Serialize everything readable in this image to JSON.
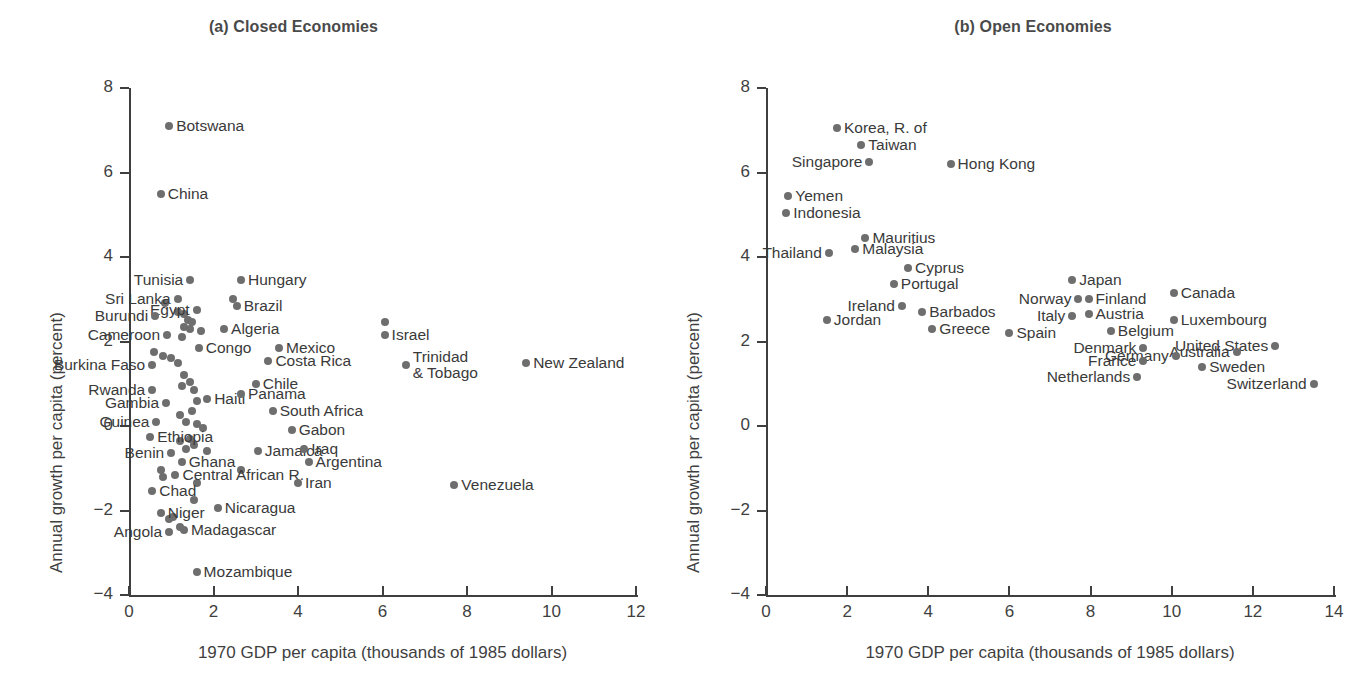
{
  "figure": {
    "panels": [
      {
        "id": "a",
        "title": "(a) Closed Economies",
        "xlabel": "1970 GDP per capita (thousands of 1985 dollars)",
        "ylabel": "Annual growth per capita (percent)"
      },
      {
        "id": "b",
        "title": "(b) Open Economies",
        "xlabel": "1970 GDP per capita (thousands of 1985 dollars)",
        "ylabel": "Annual growth per capita (percent)"
      }
    ]
  },
  "chart_data": [
    {
      "type": "scatter",
      "title": "(a) Closed Economies",
      "xlabel": "1970 GDP per capita (thousands of 1985 dollars)",
      "ylabel": "Annual growth per capita (percent)",
      "xlim": [
        0,
        12
      ],
      "ylim": [
        -4,
        8
      ],
      "xticks": [
        0,
        2,
        4,
        6,
        8,
        10,
        12
      ],
      "yticks": [
        8,
        6,
        4,
        2,
        0,
        -2,
        -4
      ],
      "grid": false,
      "legend": null,
      "marker_color": "#6e6e6e",
      "points": [
        {
          "label": "Botswana",
          "x": 0.95,
          "y": 7.1,
          "side": "l"
        },
        {
          "label": "China",
          "x": 0.75,
          "y": 5.5,
          "side": "l"
        },
        {
          "label": "Tunisia",
          "x": 1.45,
          "y": 3.45,
          "side": "r"
        },
        {
          "label": "Hungary",
          "x": 2.65,
          "y": 3.45,
          "side": "l"
        },
        {
          "label": "Sri Lanka",
          "x": 1.15,
          "y": 3.0,
          "side": "r"
        },
        {
          "label": "Brazil",
          "x": 2.55,
          "y": 2.85,
          "side": "l"
        },
        {
          "label": "Egypt",
          "x": 1.6,
          "y": 2.75,
          "side": "r"
        },
        {
          "label": "Burundi",
          "x": 0.62,
          "y": 2.6,
          "side": "r"
        },
        {
          "label": "Algeria",
          "x": 2.25,
          "y": 2.3,
          "side": "l"
        },
        {
          "label": "Cameroon",
          "x": 0.9,
          "y": 2.15,
          "side": "r"
        },
        {
          "label": "Congo",
          "x": 1.65,
          "y": 1.85,
          "side": "l"
        },
        {
          "label": "Israel",
          "x": 6.05,
          "y": 2.15,
          "side": "l"
        },
        {
          "label": "Mexico",
          "x": 3.55,
          "y": 1.85,
          "side": "l"
        },
        {
          "label": "Costa Rica",
          "x": 3.3,
          "y": 1.55,
          "side": "l"
        },
        {
          "label": "Burkina Faso",
          "x": 0.55,
          "y": 1.45,
          "side": "r"
        },
        {
          "label": "Trinidad\n& Tobago",
          "x": 6.55,
          "y": 1.45,
          "side": "l"
        },
        {
          "label": "New Zealand",
          "x": 9.4,
          "y": 1.5,
          "side": "l"
        },
        {
          "label": "Chile",
          "x": 3.0,
          "y": 1.0,
          "side": "l"
        },
        {
          "label": "Rwanda",
          "x": 0.55,
          "y": 0.85,
          "side": "r"
        },
        {
          "label": "Haiti",
          "x": 1.85,
          "y": 0.65,
          "side": "l"
        },
        {
          "label": "Panama",
          "x": 2.65,
          "y": 0.75,
          "side": "l"
        },
        {
          "label": "Gambia",
          "x": 0.88,
          "y": 0.55,
          "side": "r"
        },
        {
          "label": "South Africa",
          "x": 3.4,
          "y": 0.35,
          "side": "l"
        },
        {
          "label": "Guinea",
          "x": 0.65,
          "y": 0.1,
          "side": "r"
        },
        {
          "label": "Gabon",
          "x": 3.85,
          "y": -0.1,
          "side": "l"
        },
        {
          "label": "Ethiopia",
          "x": 0.5,
          "y": -0.25,
          "side": "l"
        },
        {
          "label": "Jamaica",
          "x": 3.05,
          "y": -0.6,
          "side": "l"
        },
        {
          "label": "Iraq",
          "x": 4.15,
          "y": -0.55,
          "side": "l"
        },
        {
          "label": "Benin",
          "x": 1.0,
          "y": -0.65,
          "side": "r"
        },
        {
          "label": "Argentina",
          "x": 4.25,
          "y": -0.85,
          "side": "l"
        },
        {
          "label": "Ghana",
          "x": 1.25,
          "y": -0.85,
          "side": "l"
        },
        {
          "label": "Central African R.",
          "x": 1.1,
          "y": -1.15,
          "side": "l"
        },
        {
          "label": "Iran",
          "x": 4.0,
          "y": -1.35,
          "side": "l"
        },
        {
          "label": "Venezuela",
          "x": 7.7,
          "y": -1.4,
          "side": "l"
        },
        {
          "label": "Chad",
          "x": 0.55,
          "y": -1.55,
          "side": "l"
        },
        {
          "label": "Niger",
          "x": 0.75,
          "y": -2.05,
          "side": "l"
        },
        {
          "label": "Nicaragua",
          "x": 2.1,
          "y": -1.95,
          "side": "l"
        },
        {
          "label": "Madagascar",
          "x": 1.3,
          "y": -2.45,
          "side": "l"
        },
        {
          "label": "Angola",
          "x": 0.95,
          "y": -2.5,
          "side": "r"
        },
        {
          "label": "Mozambique",
          "x": 1.6,
          "y": -3.45,
          "side": "l"
        }
      ],
      "unlabeled_points": [
        {
          "x": 0.85,
          "y": 2.9
        },
        {
          "x": 1.15,
          "y": 2.7
        },
        {
          "x": 1.3,
          "y": 2.65
        },
        {
          "x": 1.4,
          "y": 2.5
        },
        {
          "x": 1.5,
          "y": 2.45
        },
        {
          "x": 1.3,
          "y": 2.35
        },
        {
          "x": 1.45,
          "y": 2.3
        },
        {
          "x": 1.7,
          "y": 2.25
        },
        {
          "x": 1.25,
          "y": 2.1
        },
        {
          "x": 0.6,
          "y": 1.75
        },
        {
          "x": 0.8,
          "y": 1.65
        },
        {
          "x": 1.0,
          "y": 1.6
        },
        {
          "x": 1.15,
          "y": 1.5
        },
        {
          "x": 1.3,
          "y": 1.2
        },
        {
          "x": 1.45,
          "y": 1.05
        },
        {
          "x": 1.25,
          "y": 0.95
        },
        {
          "x": 1.55,
          "y": 0.85
        },
        {
          "x": 1.6,
          "y": 0.6
        },
        {
          "x": 1.5,
          "y": 0.35
        },
        {
          "x": 1.2,
          "y": 0.25
        },
        {
          "x": 1.35,
          "y": 0.1
        },
        {
          "x": 1.6,
          "y": 0.05
        },
        {
          "x": 1.75,
          "y": -0.05
        },
        {
          "x": 1.45,
          "y": -0.3
        },
        {
          "x": 1.2,
          "y": -0.35
        },
        {
          "x": 1.55,
          "y": -0.45
        },
        {
          "x": 1.35,
          "y": -0.55
        },
        {
          "x": 1.85,
          "y": -0.6
        },
        {
          "x": 0.75,
          "y": -1.05
        },
        {
          "x": 0.8,
          "y": -1.2
        },
        {
          "x": 2.65,
          "y": -1.05
        },
        {
          "x": 1.6,
          "y": -1.35
        },
        {
          "x": 1.05,
          "y": -2.15
        },
        {
          "x": 0.95,
          "y": -2.2
        },
        {
          "x": 1.55,
          "y": -1.75
        },
        {
          "x": 1.2,
          "y": -2.4
        },
        {
          "x": 2.45,
          "y": 3.0
        },
        {
          "x": 6.05,
          "y": 2.45
        }
      ]
    },
    {
      "type": "scatter",
      "title": "(b) Open Economies",
      "xlabel": "1970 GDP per capita (thousands of 1985 dollars)",
      "ylabel": "Annual growth per capita (percent)",
      "xlim": [
        0,
        14
      ],
      "ylim": [
        -4,
        8
      ],
      "xticks": [
        0,
        2,
        4,
        6,
        8,
        10,
        12,
        14
      ],
      "yticks": [
        8,
        6,
        4,
        2,
        0,
        -2,
        -4
      ],
      "grid": false,
      "legend": null,
      "marker_color": "#6e6e6e",
      "points": [
        {
          "label": "Korea, R. of",
          "x": 1.75,
          "y": 7.05,
          "side": "l"
        },
        {
          "label": "Taiwan",
          "x": 2.35,
          "y": 6.65,
          "side": "l"
        },
        {
          "label": "Singapore",
          "x": 2.55,
          "y": 6.25,
          "side": "r"
        },
        {
          "label": "Hong Kong",
          "x": 4.55,
          "y": 6.2,
          "side": "l"
        },
        {
          "label": "Yemen",
          "x": 0.55,
          "y": 5.45,
          "side": "l"
        },
        {
          "label": "Indonesia",
          "x": 0.5,
          "y": 5.05,
          "side": "l"
        },
        {
          "label": "Mauritius",
          "x": 2.45,
          "y": 4.45,
          "side": "l"
        },
        {
          "label": "Malaysia",
          "x": 2.2,
          "y": 4.2,
          "side": "l"
        },
        {
          "label": "Thailand",
          "x": 1.55,
          "y": 4.1,
          "side": "r"
        },
        {
          "label": "Cyprus",
          "x": 3.5,
          "y": 3.75,
          "side": "l"
        },
        {
          "label": "Japan",
          "x": 7.55,
          "y": 3.45,
          "side": "l"
        },
        {
          "label": "Portugal",
          "x": 3.15,
          "y": 3.35,
          "side": "l"
        },
        {
          "label": "Canada",
          "x": 10.05,
          "y": 3.15,
          "side": "l"
        },
        {
          "label": "Norway",
          "x": 7.7,
          "y": 3.0,
          "side": "r"
        },
        {
          "label": "Finland",
          "x": 7.95,
          "y": 3.0,
          "side": "l"
        },
        {
          "label": "Ireland",
          "x": 3.35,
          "y": 2.85,
          "side": "r"
        },
        {
          "label": "Barbados",
          "x": 3.85,
          "y": 2.7,
          "side": "l"
        },
        {
          "label": "Austria",
          "x": 7.95,
          "y": 2.65,
          "side": "l"
        },
        {
          "label": "Italy",
          "x": 7.55,
          "y": 2.6,
          "side": "r"
        },
        {
          "label": "Jordan",
          "x": 1.5,
          "y": 2.5,
          "side": "l"
        },
        {
          "label": "Luxembourg",
          "x": 10.05,
          "y": 2.5,
          "side": "l"
        },
        {
          "label": "Greece",
          "x": 4.1,
          "y": 2.3,
          "side": "l"
        },
        {
          "label": "Belgium",
          "x": 8.5,
          "y": 2.25,
          "side": "l"
        },
        {
          "label": "Spain",
          "x": 6.0,
          "y": 2.2,
          "side": "l"
        },
        {
          "label": "United States",
          "x": 12.55,
          "y": 1.9,
          "side": "r"
        },
        {
          "label": "Denmark",
          "x": 9.3,
          "y": 1.85,
          "side": "r"
        },
        {
          "label": "Australia",
          "x": 11.6,
          "y": 1.75,
          "side": "r"
        },
        {
          "label": "Germany",
          "x": 10.1,
          "y": 1.65,
          "side": "r"
        },
        {
          "label": "France",
          "x": 9.3,
          "y": 1.55,
          "side": "r"
        },
        {
          "label": "Sweden",
          "x": 10.75,
          "y": 1.4,
          "side": "l"
        },
        {
          "label": "Netherlands",
          "x": 9.15,
          "y": 1.15,
          "side": "r"
        },
        {
          "label": "Switzerland",
          "x": 13.5,
          "y": 1.0,
          "side": "r"
        }
      ],
      "unlabeled_points": []
    }
  ]
}
